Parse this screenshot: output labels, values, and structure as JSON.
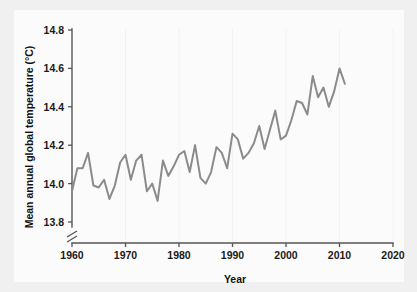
{
  "chart_data": {
    "type": "line",
    "title": "",
    "xlabel": "Year",
    "ylabel": "Mean annual global temperature (°C)",
    "xlim": [
      1960,
      2020
    ],
    "ylim": [
      13.8,
      14.8
    ],
    "y_axis_break": true,
    "grid": "faint vertical gridlines at decade ticks",
    "legend": "none",
    "xticks": [
      1960,
      1970,
      1980,
      1990,
      2000,
      2010,
      2020
    ],
    "xtick_labels": [
      "1960",
      "1970",
      "1980",
      "1990",
      "2000",
      "2010",
      "2020"
    ],
    "yticks": [
      13.8,
      14.0,
      14.2,
      14.4,
      14.6,
      14.8
    ],
    "ytick_labels": [
      "13.8",
      "14.0",
      "14.2",
      "14.4",
      "14.6",
      "14.8"
    ],
    "series": [
      {
        "name": "Mean annual global temperature",
        "color": "#8b8b8b",
        "x": [
          1960,
          1961,
          1962,
          1963,
          1964,
          1965,
          1966,
          1967,
          1968,
          1969,
          1970,
          1971,
          1972,
          1973,
          1974,
          1975,
          1976,
          1977,
          1978,
          1979,
          1980,
          1981,
          1982,
          1983,
          1984,
          1985,
          1986,
          1987,
          1988,
          1989,
          1990,
          1991,
          1992,
          1993,
          1994,
          1995,
          1996,
          1997,
          1998,
          1999,
          2000,
          2001,
          2002,
          2003,
          2004,
          2005,
          2006,
          2007,
          2008,
          2009,
          2010,
          2011
        ],
        "values": [
          13.96,
          14.08,
          14.08,
          14.16,
          13.99,
          13.98,
          14.02,
          13.92,
          13.99,
          14.11,
          14.15,
          14.02,
          14.12,
          14.15,
          13.96,
          14.0,
          13.91,
          14.12,
          14.04,
          14.09,
          14.15,
          14.17,
          14.06,
          14.2,
          14.03,
          14.0,
          14.06,
          14.19,
          14.16,
          14.08,
          14.26,
          14.23,
          14.13,
          14.16,
          14.21,
          14.3,
          14.18,
          14.28,
          14.38,
          14.23,
          14.25,
          14.33,
          14.43,
          14.42,
          14.36,
          14.56,
          14.45,
          14.5,
          14.4,
          14.48,
          14.6,
          14.52
        ]
      }
    ]
  },
  "axis_titles": {
    "x": "Year",
    "y": "Mean annual global temperature (°C)"
  },
  "colors": {
    "line": "#8b8b8b",
    "axis": "#555555",
    "page_background": "#f0f0f0",
    "plot_background": "#fbfbfb",
    "text": "#1a1a1a"
  }
}
